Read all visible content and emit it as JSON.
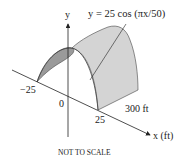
{
  "diagram": {
    "equation_label": "y = 25 cos (πx/50)",
    "y_axis_label": "y",
    "x_axis_label": "x (ft)",
    "tick_neg": "−25",
    "tick_zero": "0",
    "tick_pos": "25",
    "length_label": "300 ft",
    "footnote": "NOT TO SCALE",
    "colors": {
      "surface_light": "#d4d4d4",
      "surface_dark": "#9a9a9a",
      "line": "#222222"
    }
  }
}
